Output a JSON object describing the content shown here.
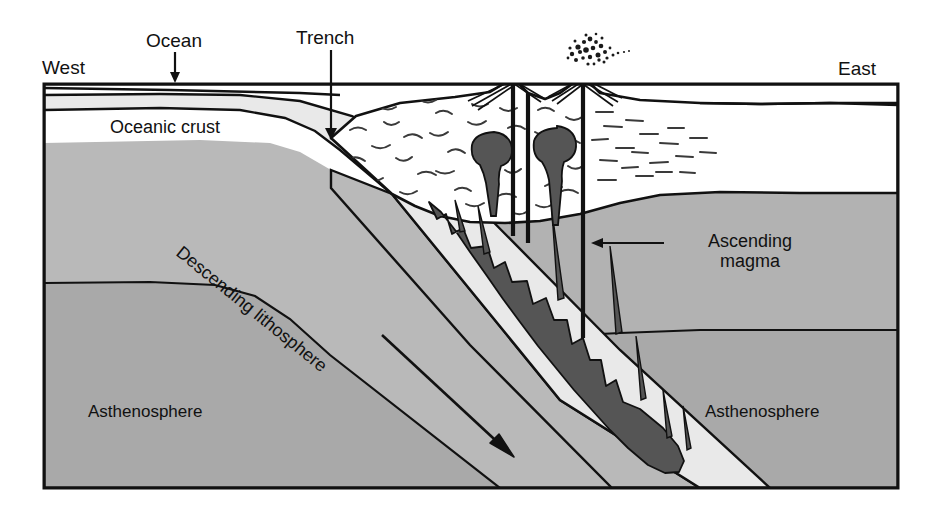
{
  "figure": {
    "kind": "geologic-cross-section",
    "canvas": {
      "width": 936,
      "height": 508
    },
    "frame": {
      "left": 44,
      "top": 84,
      "right": 898,
      "bottom": 488
    }
  },
  "labels": {
    "west": "West",
    "east": "East",
    "ocean": "Ocean",
    "trench": "Trench",
    "oceanic_crust": "Oceanic crust",
    "descending_lithosphere": "Descending lithosphere",
    "ascending_magma_line1": "Ascending",
    "ascending_magma_line2": "magma",
    "asthenosphere_left": "Asthenosphere",
    "asthenosphere_right": "Asthenosphere"
  },
  "annotations": [
    {
      "name": "ocean-arrow",
      "icon": "down-arrow-icon",
      "from": [
        175,
        52
      ],
      "to": [
        175,
        80
      ]
    },
    {
      "name": "trench-arrow",
      "icon": "down-arrow-icon",
      "from": [
        331,
        50
      ],
      "to": [
        331,
        137
      ]
    },
    {
      "name": "magma-arrow",
      "icon": "left-arrow-icon",
      "from": [
        660,
        243
      ],
      "to": [
        592,
        243
      ]
    },
    {
      "name": "descent-arrow",
      "icon": "diagonal-arrow-icon",
      "from": [
        382,
        335
      ],
      "to": [
        514,
        457
      ]
    }
  ],
  "features": {
    "ash_cloud": {
      "name": "ash-cloud",
      "center": [
        590,
        48
      ]
    },
    "volcano_peaks": [
      {
        "x": 513,
        "y": 78
      },
      {
        "x": 583,
        "y": 76
      }
    ],
    "magma_chambers": [
      {
        "x": 494,
        "y": 152
      },
      {
        "x": 556,
        "y": 146
      }
    ],
    "volcanic_conduits_x": [
      513,
      528,
      583
    ]
  },
  "colors": {
    "background": "#ffffff",
    "ocean_water": "#ffffff",
    "oceanic_crust": "#e9e9e9",
    "lithospheric_mantle": "#b9b9b9",
    "asthenosphere": "#a9a9a9",
    "continental_crust": "#ffffff",
    "magma": "#555555",
    "outline": "#111111",
    "text": "#111111"
  }
}
